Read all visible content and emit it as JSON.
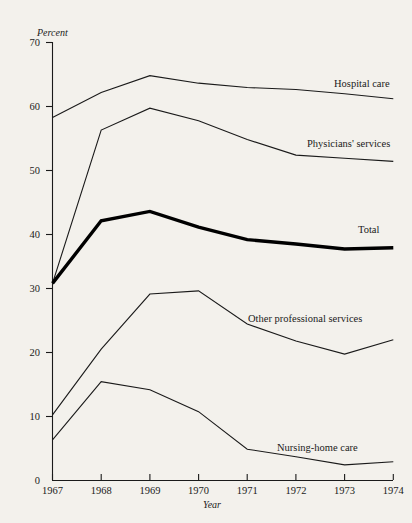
{
  "chart_data": {
    "type": "line",
    "title": "",
    "xlabel": "Year",
    "ylabel": "Percent",
    "x": [
      1967,
      1968,
      1969,
      1970,
      1971,
      1972,
      1973,
      1974
    ],
    "xtick_labels": [
      "1967",
      "1968",
      "1969",
      "1970",
      "1971",
      "1972",
      "1973",
      "1974"
    ],
    "ytick_labels": [
      "0",
      "10",
      "20",
      "30",
      "40",
      "50",
      "60",
      "70"
    ],
    "yticks": [
      0,
      10,
      20,
      30,
      40,
      50,
      60,
      70
    ],
    "ylim": [
      0,
      70
    ],
    "xlim": [
      1967,
      1974
    ],
    "grid": false,
    "legend_position": "inline-right-of-line-ends",
    "series": [
      {
        "name": "Hospital care",
        "label": "Hospital care",
        "emphasis": "normal",
        "values": [
          58.0,
          62.0,
          64.7,
          63.5,
          62.8,
          62.5,
          61.8,
          61.0
        ]
      },
      {
        "name": "Physicians' services",
        "label": "Physicians' services",
        "emphasis": "normal",
        "values": [
          31.5,
          56.0,
          59.5,
          57.5,
          54.5,
          52.0,
          51.5,
          51.0
        ]
      },
      {
        "name": "Total",
        "label": "Total",
        "emphasis": "bold",
        "values": [
          31.5,
          41.5,
          43.0,
          40.5,
          38.5,
          37.8,
          37.0,
          37.2
        ]
      },
      {
        "name": "Other professional services",
        "label": "Other professional services",
        "emphasis": "normal",
        "values": [
          10.5,
          21.0,
          29.8,
          30.3,
          25.0,
          22.3,
          20.2,
          22.5
        ]
      },
      {
        "name": "Nursing-home care",
        "label": "Nursing-home care",
        "emphasis": "normal",
        "values": [
          6.5,
          15.8,
          14.5,
          11.0,
          5.0,
          3.8,
          2.5,
          3.0
        ]
      }
    ],
    "colors": {
      "line": "#1a1a1a",
      "background": "#f3f1ec",
      "axis": "#1a1a1a"
    }
  },
  "labels": {
    "hospital_care": "Hospital care",
    "physicians_services": "Physicians' services",
    "total": "Total",
    "other_professional_services": "Other professional services",
    "nursing_home_care": "Nursing-home care",
    "percent": "Percent",
    "year": "Year"
  },
  "ytick_text": {
    "t70": "70",
    "t60": "60",
    "t50": "50",
    "t40": "40",
    "t30": "30",
    "t20": "20",
    "t10": "10",
    "t0": "0"
  },
  "xtick_text": {
    "x1967": "1967",
    "x1968": "1968",
    "x1969": "1969",
    "x1970": "1970",
    "x1971": "1971",
    "x1972": "1972",
    "x1973": "1973",
    "x1974": "1974"
  }
}
